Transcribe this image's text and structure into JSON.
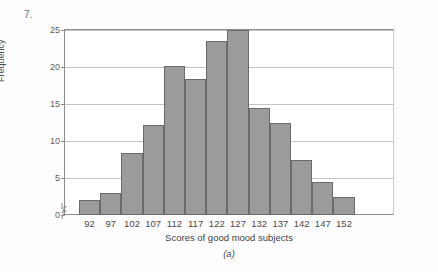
{
  "problem_number": "7.",
  "figure": {
    "caption": "(a)",
    "axis_break_icon": "axis-break-zigzag-icon"
  },
  "chart_data": {
    "type": "bar",
    "title": "",
    "xlabel": "Scores of good mood subjects",
    "ylabel": "Frequency",
    "categories": [
      "92",
      "97",
      "102",
      "107",
      "112",
      "117",
      "122",
      "127",
      "132",
      "137",
      "142",
      "147",
      "152"
    ],
    "values": [
      2,
      3,
      8.4,
      12.2,
      20.2,
      18.4,
      23.5,
      25,
      14.4,
      12.5,
      7.5,
      4.5,
      2.5
    ],
    "xlim": [
      89.5,
      164.5
    ],
    "ylim": [
      0,
      25
    ],
    "yticks": [
      0,
      5,
      10,
      15,
      20,
      25
    ],
    "ytick_labels": [
      "0",
      "5",
      "10",
      "15",
      "20",
      "25"
    ],
    "grid": "horizontal",
    "legend": "none",
    "bar_color": "#9b9b9b",
    "bar_edge_color": "#6b6b6b"
  }
}
